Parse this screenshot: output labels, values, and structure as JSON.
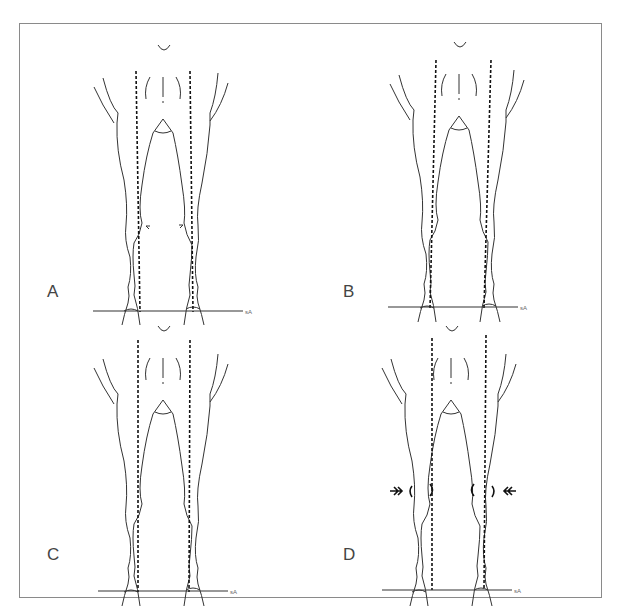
{
  "figure": {
    "colors": {
      "line": "#333333",
      "frame": "#8a8a8a",
      "background": "#ffffff"
    },
    "panels": [
      {
        "id": "A",
        "label": "A",
        "markers": "small curved arrows pointing inward at the knees"
      },
      {
        "id": "B",
        "label": "B",
        "markers": "none"
      },
      {
        "id": "C",
        "label": "C",
        "markers": "none"
      },
      {
        "id": "D",
        "label": "D",
        "markers": "double chevron arrows pointing at the knees from outside"
      }
    ],
    "signature_mark": "sA"
  }
}
